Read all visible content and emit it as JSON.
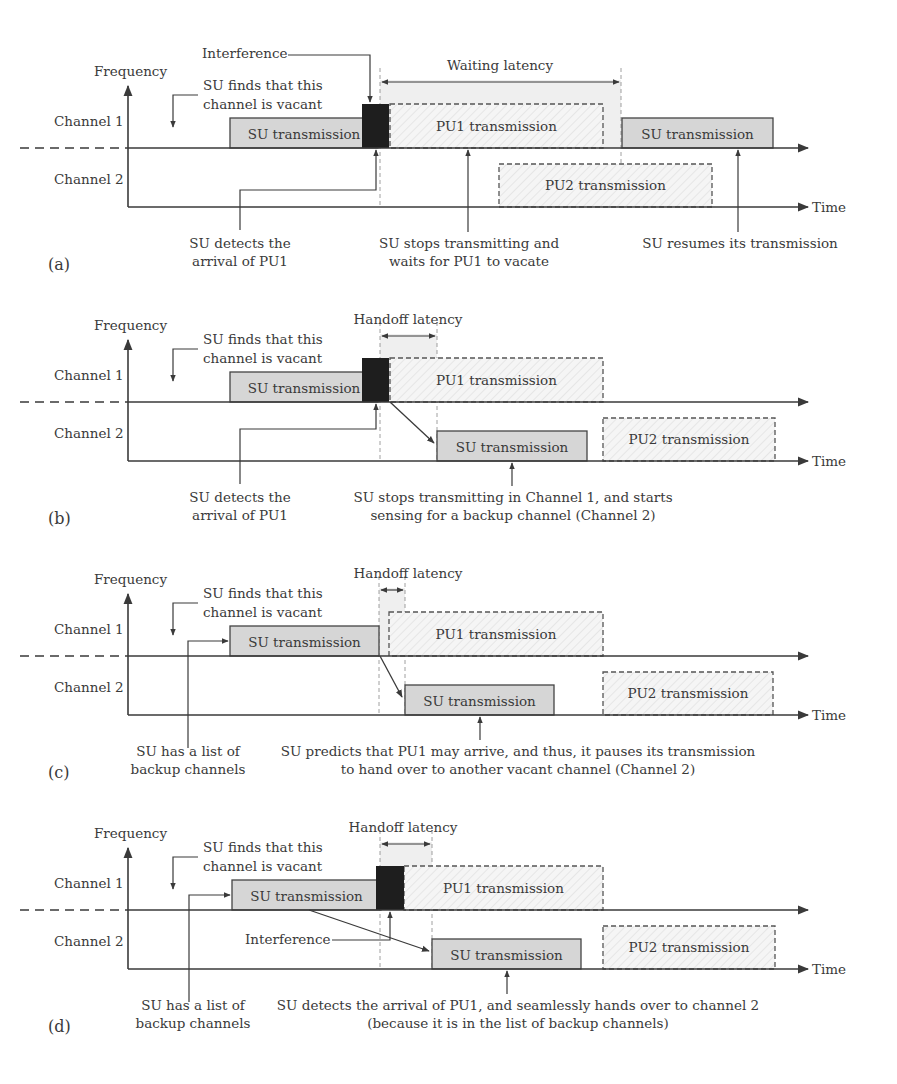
{
  "colors": {
    "axis": "#3a3a3a",
    "su_fill": "#d6d6d6",
    "pu_fill": "#f4f4f4",
    "interference": "#1e1e1e",
    "latency_band": "#efefef",
    "text": "#3a3a3a"
  },
  "common": {
    "frequency": "Frequency",
    "time": "Time",
    "channel1": "Channel 1",
    "channel2": "Channel 2",
    "su_tx": "SU transmission",
    "pu1_tx": "PU1 transmission",
    "pu2_tx": "PU2 transmission",
    "vacant": [
      "SU finds that this",
      "channel is vacant"
    ],
    "interference": "Interference"
  },
  "panels": [
    {
      "id": "a",
      "label": "(a)",
      "y0": 0,
      "latency": {
        "label": "Waiting latency",
        "x1": 380,
        "x2": 621,
        "label_x": 500
      },
      "interference_label": {
        "x": 202,
        "y": 58
      },
      "su1": {
        "x1": 230,
        "x2": 378
      },
      "interf_block": {
        "x1": 362,
        "x2": 389
      },
      "pu1": {
        "x1": 390,
        "x2": 603
      },
      "su1b": {
        "x1": 622,
        "x2": 773
      },
      "su2": null,
      "pu2": {
        "x1": 499,
        "x2": 712
      },
      "handover_arrow": null,
      "backup_pointer": false,
      "notes": [
        {
          "lines": [
            "SU detects the",
            "arrival of PU1"
          ],
          "cx": 240
        },
        {
          "lines": [
            "SU stops transmitting and",
            "waits for PU1 to vacate"
          ],
          "cx": 469
        },
        {
          "lines": [
            "SU resumes its transmission"
          ],
          "cx": 740
        }
      ],
      "note_pointers": [
        {
          "type": "elbow",
          "fromX": 240,
          "toX": 376,
          "elbowY": 190
        },
        {
          "type": "up",
          "x": 468,
          "row": "ch1"
        },
        {
          "type": "up",
          "x": 738,
          "row": "ch1"
        }
      ]
    },
    {
      "id": "b",
      "label": "(b)",
      "y0": 254,
      "latency": {
        "label": "Handoff latency",
        "x1": 380,
        "x2": 437,
        "label_x": 408
      },
      "su1": {
        "x1": 230,
        "x2": 378
      },
      "interf_block": {
        "x1": 362,
        "x2": 389
      },
      "pu1": {
        "x1": 390,
        "x2": 603
      },
      "su1b": null,
      "su2": {
        "x1": 437,
        "x2": 587
      },
      "pu2": {
        "x1": 603,
        "x2": 775
      },
      "handover_arrow": {
        "x1": 390,
        "x2": 437
      },
      "backup_pointer": false,
      "notes": [
        {
          "lines": [
            "SU detects the",
            "arrival of PU1"
          ],
          "cx": 240
        },
        {
          "lines": [
            "SU stops transmitting in Channel 1, and starts",
            "sensing for a backup channel (Channel 2)"
          ],
          "cx": 513
        }
      ],
      "note_pointers": [
        {
          "type": "elbow",
          "fromX": 240,
          "toX": 376,
          "elbowY": 175
        },
        {
          "type": "up",
          "x": 512,
          "row": "ch2"
        }
      ]
    },
    {
      "id": "c",
      "label": "(c)",
      "y0": 508,
      "latency": {
        "label": "Handoff latency",
        "x1": 379,
        "x2": 405,
        "label_x": 408
      },
      "su1": {
        "x1": 230,
        "x2": 379
      },
      "interf_block": null,
      "pu1": {
        "x1": 389,
        "x2": 603
      },
      "su1b": null,
      "su2": {
        "x1": 405,
        "x2": 554
      },
      "pu2": {
        "x1": 603,
        "x2": 773
      },
      "handover_arrow": {
        "x1": 380,
        "x2": 405
      },
      "backup_pointer": true,
      "notes": [
        {
          "lines": [
            "SU has a list of",
            "backup channels"
          ],
          "cx": 188
        },
        {
          "lines": [
            "SU predicts that PU1 may arrive, and thus, it pauses its transmission",
            "to hand over to another vacant channel (Channel 2)"
          ],
          "cx": 518
        }
      ],
      "note_pointers": [
        {
          "type": "up",
          "x": 480,
          "row": "ch2"
        }
      ]
    },
    {
      "id": "d",
      "label": "(d)",
      "y0": 762,
      "latency": {
        "label": "Handoff latency",
        "x1": 380,
        "x2": 432,
        "label_x": 403
      },
      "interference_label": {
        "x": 245,
        "y": 178,
        "below": true
      },
      "su1": {
        "x1": 232,
        "x2": 381
      },
      "interf_block": {
        "x1": 376,
        "x2": 404
      },
      "pu1": {
        "x1": 404,
        "x2": 603
      },
      "su1b": null,
      "su2": {
        "x1": 432,
        "x2": 581
      },
      "pu2": {
        "x1": 603,
        "x2": 775
      },
      "handover_arrow": {
        "x1": 309,
        "x2": 432
      },
      "backup_pointer": true,
      "notes": [
        {
          "lines": [
            "SU has a list of",
            "backup channels"
          ],
          "cx": 193
        },
        {
          "lines": [
            "SU detects the arrival of PU1, and seamlessly hands over to channel 2",
            "(because it is in the list of backup channels)"
          ],
          "cx": 518
        }
      ],
      "note_pointers": [
        {
          "type": "up",
          "x": 507,
          "row": "ch2"
        }
      ]
    }
  ]
}
